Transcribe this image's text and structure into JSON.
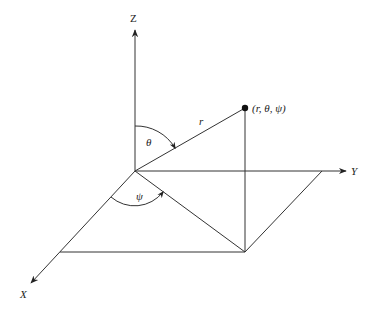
{
  "diagram": {
    "type": "spherical-coordinate-system",
    "colors": {
      "stroke": "#333333",
      "text": "#222222",
      "background": "#ffffff"
    },
    "axes": {
      "z": {
        "label": "Z"
      },
      "y": {
        "label": "Y"
      },
      "x": {
        "label": "X"
      }
    },
    "point": {
      "label": "(r, θ, ψ)"
    },
    "radius_label": "r",
    "polar_angle_label": "θ",
    "azimuth_angle_label": "ψ"
  }
}
